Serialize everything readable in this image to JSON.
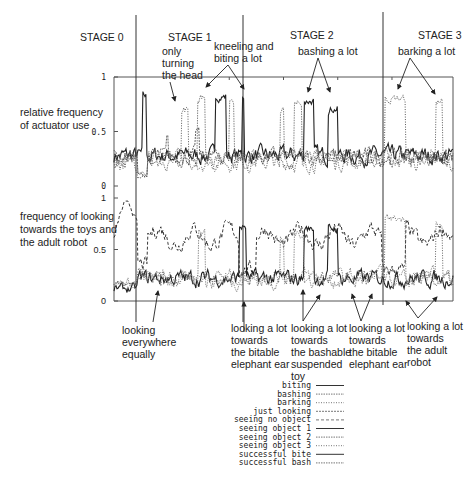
{
  "chart_data": {
    "type": "line",
    "title": "",
    "stages": [
      {
        "label": "STAGE 0",
        "start": 0,
        "end": 0.07
      },
      {
        "label": "STAGE 1",
        "start": 0.07,
        "end": 0.38
      },
      {
        "label": "STAGE 2",
        "start": 0.38,
        "end": 0.79
      },
      {
        "label": "STAGE 3",
        "start": 0.79,
        "end": 1.0
      }
    ],
    "panels": [
      {
        "id": "actuator",
        "ylabel_lines": [
          "relative frequency",
          "of actuator use"
        ],
        "ylim": [
          0,
          1
        ],
        "yticks": [
          {
            "v": 0,
            "label": "0"
          },
          {
            "v": 0.5,
            "label": "0.5"
          },
          {
            "v": 1,
            "label": "1"
          }
        ],
        "series": [
          {
            "name": "biting",
            "style": "solid",
            "color": "#222222",
            "baseline": 0.28,
            "bursts": [
              [
                0.085,
                0.095,
                0.82
              ],
              [
                0.3,
                0.33,
                0.82
              ],
              [
                0.377,
                0.385,
                0.83
              ],
              [
                0.56,
                0.59,
                0.78
              ],
              [
                0.63,
                0.66,
                0.71
              ]
            ]
          },
          {
            "name": "bashing",
            "style": "dotted-light",
            "color": "#777777",
            "baseline": 0.25,
            "bursts": [
              [
                0.245,
                0.27,
                0.82
              ],
              [
                0.49,
                0.5,
                0.7
              ],
              [
                0.53,
                0.555,
                0.78
              ],
              [
                0.34,
                0.355,
                0.74
              ]
            ]
          },
          {
            "name": "barking",
            "style": "dotted",
            "color": "#444444",
            "baseline": 0.22,
            "bursts": [
              [
                0.2,
                0.22,
                0.7
              ],
              [
                0.8,
                0.86,
                0.8
              ],
              [
                0.95,
                0.97,
                0.78
              ]
            ]
          },
          {
            "name": "just looking",
            "style": "dense-dotted",
            "color": "#555555",
            "baseline": 0.27,
            "bursts": [
              [
                0.155,
                0.16,
                0.46
              ],
              [
                0.24,
                0.25,
                0.5
              ]
            ]
          }
        ]
      },
      {
        "id": "looking",
        "ylabel_lines": [
          "frequency of looking",
          "towards the toys and",
          "the adult robot"
        ],
        "ylim": [
          0,
          1
        ],
        "yticks": [
          {
            "v": 0,
            "label": "0"
          },
          {
            "v": 0.5,
            "label": "0.5"
          },
          {
            "v": 1,
            "label": "1"
          }
        ],
        "series": [
          {
            "name": "seeing no object",
            "style": "dashed",
            "color": "#222222",
            "baseline": 0.62,
            "stage0": 0.9
          },
          {
            "name": "seeing object 1",
            "style": "solid",
            "color": "#222222",
            "baseline": 0.22,
            "stage0": 0.12,
            "bursts": [
              [
                0.37,
                0.39,
                0.72
              ],
              [
                0.56,
                0.59,
                0.7
              ],
              [
                0.63,
                0.66,
                0.7
              ]
            ]
          },
          {
            "name": "seeing object 2",
            "style": "dotted-light",
            "color": "#888888",
            "baseline": 0.2,
            "stage0": 0.18,
            "bursts": [
              [
                0.49,
                0.5,
                0.6
              ],
              [
                0.53,
                0.56,
                0.65
              ],
              [
                0.25,
                0.27,
                0.7
              ]
            ]
          },
          {
            "name": "seeing object 3",
            "style": "dotted",
            "color": "#555555",
            "baseline": 0.24,
            "stage0": 0.15,
            "bursts": [
              [
                0.8,
                0.86,
                0.8
              ],
              [
                0.95,
                0.97,
                0.75
              ]
            ]
          }
        ]
      }
    ],
    "annotations_top": [
      {
        "text": [
          "only",
          "turning",
          "the head"
        ]
      },
      {
        "text": [
          "kneeling and",
          "biting a lot"
        ]
      },
      {
        "text": [
          "bashing a lot"
        ]
      },
      {
        "text": [
          "barking a lot"
        ]
      }
    ],
    "annotations_bottom": [
      {
        "text": [
          "looking",
          "everywhere",
          "equally"
        ]
      },
      {
        "text": [
          "looking a lot",
          "towards",
          "the bitable",
          "elephant ear"
        ]
      },
      {
        "text": [
          "looking a lot",
          "towards",
          "the bashable",
          "suspended",
          "toy"
        ]
      },
      {
        "text": [
          "looking a lot",
          "towards",
          "the bitable",
          "elephant ear"
        ]
      },
      {
        "text": [
          "looking a lot",
          "towards",
          "the adult",
          "robot"
        ]
      }
    ],
    "legend": [
      {
        "label": "biting",
        "style": "solid"
      },
      {
        "label": "bashing",
        "style": "dotted-light"
      },
      {
        "label": "barking",
        "style": "dotted"
      },
      {
        "label": "just looking",
        "style": "dense-dotted"
      },
      {
        "label": "seeing no object",
        "style": "dashed"
      },
      {
        "label": "seeing object 1",
        "style": "solid"
      },
      {
        "label": "seeing object 2",
        "style": "dotted-light"
      },
      {
        "label": "seeing object 3",
        "style": "dotted"
      },
      {
        "label": "successful bite",
        "style": "solid"
      },
      {
        "label": "successful bash",
        "style": "dotted-light"
      }
    ],
    "legend_placement": "bottom-center"
  }
}
